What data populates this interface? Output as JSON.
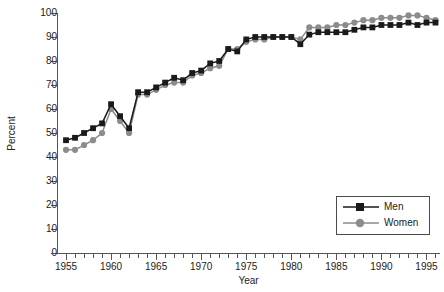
{
  "chart_data": {
    "type": "line",
    "title": "",
    "xlabel": "Year",
    "ylabel": "Percent",
    "xlim": [
      1954,
      1996.5
    ],
    "ylim": [
      0,
      100
    ],
    "ytick_labels": [
      "0",
      "10",
      "20",
      "30",
      "40",
      "50",
      "60",
      "70",
      "80",
      "90",
      "100"
    ],
    "ytick_values": [
      0,
      10,
      20,
      30,
      40,
      50,
      60,
      70,
      80,
      90,
      100
    ],
    "xtick_major_labels": [
      "1955",
      "1960",
      "1965",
      "1970",
      "1975",
      "1980",
      "1985",
      "1990",
      "1995"
    ],
    "xtick_major_values": [
      1955,
      1960,
      1965,
      1970,
      1975,
      1980,
      1985,
      1990,
      1995
    ],
    "xtick_minor_step": 1,
    "grid": false,
    "legend_position": "lower-right",
    "x": [
      1955,
      1956,
      1957,
      1958,
      1959,
      1960,
      1961,
      1962,
      1963,
      1964,
      1965,
      1966,
      1967,
      1968,
      1969,
      1970,
      1971,
      1972,
      1973,
      1974,
      1975,
      1976,
      1977,
      1978,
      1979,
      1980,
      1981,
      1982,
      1983,
      1984,
      1985,
      1986,
      1987,
      1988,
      1989,
      1990,
      1991,
      1992,
      1993,
      1994,
      1995,
      1996
    ],
    "series": [
      {
        "name": "Men",
        "color": "#1a1a1a",
        "marker": "square",
        "values": [
          47,
          48,
          50,
          52,
          54,
          62,
          57,
          52,
          67,
          67,
          69,
          71,
          73,
          72,
          75,
          76,
          79,
          80,
          85,
          84,
          89,
          90,
          90,
          90,
          90,
          90,
          87,
          91,
          92,
          92,
          92,
          92,
          93,
          94,
          94,
          95,
          95,
          95,
          96,
          95,
          96,
          96
        ]
      },
      {
        "name": "Women",
        "color": "#8c8c8c",
        "marker": "circle",
        "values": [
          43,
          43,
          45,
          47,
          50,
          60,
          55,
          50,
          66,
          66,
          68,
          70,
          71,
          71,
          74,
          75,
          77,
          78,
          85,
          85,
          88,
          89,
          89,
          90,
          90,
          90,
          89,
          94,
          94,
          94,
          95,
          95,
          96,
          97,
          97,
          98,
          98,
          98,
          99,
          99,
          98,
          97
        ]
      }
    ]
  },
  "legend": {
    "items": [
      {
        "label": "Men"
      },
      {
        "label": "Women"
      }
    ]
  },
  "axes": {
    "y_title": "Percent",
    "x_title": "Year"
  },
  "colors": {
    "men": "#1a1a1a",
    "women": "#8c8c8c",
    "axis": "#555555",
    "background": "#ffffff"
  }
}
